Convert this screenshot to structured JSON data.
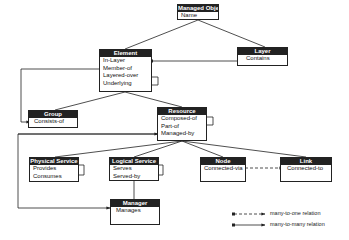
{
  "diagram": {
    "type": "class-relationship-diagram",
    "entities": [
      {
        "id": "managed_object",
        "title": "Managed Object",
        "attributes": [
          "Name"
        ]
      },
      {
        "id": "element",
        "title": "Element",
        "attributes": [
          "In-Layer",
          "Member-of",
          "Layered-over",
          "Underlying"
        ]
      },
      {
        "id": "layer",
        "title": "Layer",
        "attributes": [
          "Contains"
        ]
      },
      {
        "id": "group",
        "title": "Group",
        "attributes": [
          "Consists-of"
        ]
      },
      {
        "id": "resource",
        "title": "Resource",
        "attributes": [
          "Composed-of",
          "Part-of",
          "Managed-by"
        ]
      },
      {
        "id": "physical_service",
        "title": "Physical Service",
        "attributes": [
          "Provides",
          "Consumes"
        ]
      },
      {
        "id": "logical_service",
        "title": "Logical Service",
        "attributes": [
          "Serves",
          "Served-by"
        ]
      },
      {
        "id": "node",
        "title": "Node",
        "attributes": [
          "Connected-via"
        ]
      },
      {
        "id": "link",
        "title": "Link",
        "attributes": [
          "Connected-to"
        ]
      },
      {
        "id": "manager",
        "title": "Manager",
        "attributes": [
          "Manages"
        ]
      }
    ],
    "inheritance": [
      [
        "element",
        "managed_object"
      ],
      [
        "layer",
        "managed_object"
      ],
      [
        "group",
        "element"
      ],
      [
        "resource",
        "element"
      ],
      [
        "physical_service",
        "resource"
      ],
      [
        "logical_service",
        "resource"
      ],
      [
        "node",
        "resource"
      ],
      [
        "link",
        "resource"
      ],
      [
        "manager",
        "logical_service"
      ]
    ],
    "relations": [
      {
        "from": "element.In-Layer",
        "to": "layer.Contains",
        "kind": "many-to-many"
      },
      {
        "from": "element.Member-of",
        "to": "group.Consists-of",
        "kind": "many-to-many"
      },
      {
        "from": "element.Layered-over",
        "to": "element.Underlying",
        "kind": "many-to-many"
      },
      {
        "from": "resource.Composed-of",
        "to": "resource.Part-of",
        "kind": "many-to-many"
      },
      {
        "from": "resource.Managed-by",
        "to": "manager.Manages",
        "kind": "many-to-many"
      },
      {
        "from": "physical_service.Provides",
        "to": "physical_service.Consumes",
        "kind": "many-to-many"
      },
      {
        "from": "logical_service.Serves",
        "to": "logical_service.Served-by",
        "kind": "many-to-many"
      },
      {
        "from": "node.Connected-via",
        "to": "link.Connected-to",
        "kind": "many-to-one"
      }
    ]
  },
  "boxes": {
    "managed_object": {
      "title": "Managed Object",
      "attrs": [
        "Name"
      ]
    },
    "element": {
      "title": "Element",
      "attrs": [
        "In-Layer",
        "Member-of",
        "Layered-over",
        "Underlying"
      ]
    },
    "layer": {
      "title": "Layer",
      "attrs": [
        "Contains"
      ]
    },
    "group": {
      "title": "Group",
      "attrs": [
        "Consists-of"
      ]
    },
    "resource": {
      "title": "Resource",
      "attrs": [
        "Composed-of",
        "Part-of",
        "Managed-by"
      ]
    },
    "physical_service": {
      "title": "Physical Service",
      "attrs": [
        "Provides",
        "Consumes"
      ]
    },
    "logical_service": {
      "title": "Logical Service",
      "attrs": [
        "Serves",
        "Served-by"
      ]
    },
    "node": {
      "title": "Node",
      "attrs": [
        "Connected-via"
      ]
    },
    "link": {
      "title": "Link",
      "attrs": [
        "Connected-to"
      ]
    },
    "manager": {
      "title": "Manager",
      "attrs": [
        "Manages"
      ]
    }
  },
  "legend": {
    "many_to_one": "many-to-one relation",
    "many_to_many": "many-to-many relation"
  },
  "colors": {
    "header_bg": "#222222",
    "header_text": "#ffffff",
    "line": "#222222"
  }
}
